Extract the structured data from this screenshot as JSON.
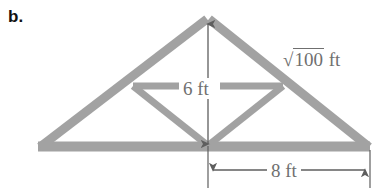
{
  "figure": {
    "part_label": "b.",
    "type": "geometry-diagram",
    "shape": "roof-truss-triangle",
    "colors": {
      "truss_gray": "#a0a0a0",
      "dimension_gray": "#6f6f6f",
      "label_black": "#111111",
      "background": "#ffffff"
    },
    "labels": {
      "height": "6 ft",
      "width": "8 ft",
      "hypotenuse_radical": "√",
      "hypotenuse_radicand": "100",
      "hypotenuse_unit": "ft",
      "hypotenuse_full": "√100 ft"
    },
    "geometry": {
      "apex": [
        208,
        18
      ],
      "left_vertex": [
        38,
        148
      ],
      "right_vertex": [
        370,
        148
      ],
      "bottom_center": [
        208,
        144
      ],
      "left_mid_rafter": [
        133,
        86
      ],
      "right_mid_rafter": [
        283,
        86
      ],
      "height_value": 6,
      "half_base_value": 8,
      "hypotenuse_value": 10,
      "units": "ft"
    },
    "dimensions": {
      "height_arrow": {
        "x": 208,
        "y_top": 22,
        "y_bottom": 146,
        "double_headed": true
      },
      "width_arrow": {
        "y": 170,
        "x_left": 209,
        "x_right": 369,
        "double_headed": true
      },
      "extension_lines": [
        {
          "x": 208,
          "y_top": 146,
          "y_bottom": 188
        },
        {
          "x": 370,
          "y_top": 150,
          "y_bottom": 188
        }
      ]
    }
  }
}
